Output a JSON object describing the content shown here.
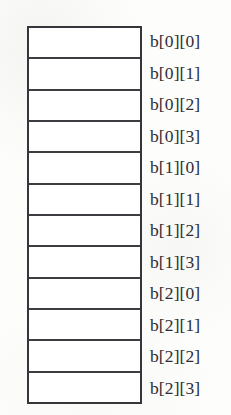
{
  "figure": {
    "kind": "array-memory-layout-diagram",
    "cell_count": 12,
    "colors": {
      "background": "#fdfdfc",
      "cell_fill": "#ffffff",
      "border": "#35353a",
      "divider": "#3c3c41",
      "label_text": "#2e2e33"
    }
  },
  "cells": [
    {
      "index": 0,
      "value": ""
    },
    {
      "index": 1,
      "value": ""
    },
    {
      "index": 2,
      "value": ""
    },
    {
      "index": 3,
      "value": ""
    },
    {
      "index": 4,
      "value": ""
    },
    {
      "index": 5,
      "value": ""
    },
    {
      "index": 6,
      "value": ""
    },
    {
      "index": 7,
      "value": ""
    },
    {
      "index": 8,
      "value": ""
    },
    {
      "index": 9,
      "value": ""
    },
    {
      "index": 10,
      "value": ""
    },
    {
      "index": 11,
      "value": ""
    }
  ],
  "labels": [
    {
      "index": 0,
      "text": "b[0][0]"
    },
    {
      "index": 1,
      "text": "b[0][1]"
    },
    {
      "index": 2,
      "text": "b[0][2]"
    },
    {
      "index": 3,
      "text": "b[0][3]"
    },
    {
      "index": 4,
      "text": "b[1][0]"
    },
    {
      "index": 5,
      "text": "b[1][1]"
    },
    {
      "index": 6,
      "text": "b[1][2]"
    },
    {
      "index": 7,
      "text": "b[1][3]"
    },
    {
      "index": 8,
      "text": "b[2][0]"
    },
    {
      "index": 9,
      "text": "b[2][1]"
    },
    {
      "index": 10,
      "text": "b[2][2]"
    },
    {
      "index": 11,
      "text": "b[2][3]"
    }
  ]
}
